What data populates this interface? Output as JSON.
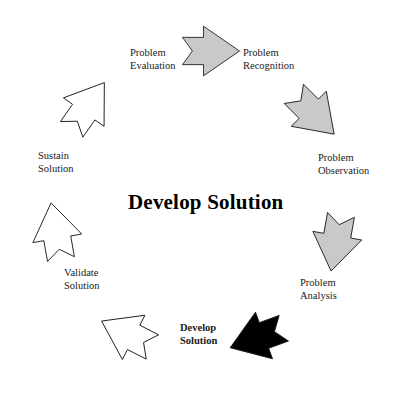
{
  "diagram": {
    "title": "Develop Solution",
    "title_position": {
      "x": 128,
      "y": 190
    },
    "type": "circular-process-cycle",
    "colors": {
      "arrow_gray_fill": "#c9c9c9",
      "arrow_white_fill": "#ffffff",
      "arrow_black_fill": "#000000",
      "arrow_outline": "#1a1a1a",
      "text": "#1a1a1a",
      "background": "#ffffff"
    },
    "stages": [
      {
        "id": "problem-recognition",
        "label_line1": "Problem",
        "label_line2": "Recognition",
        "label_x": 243,
        "label_y": 47,
        "label_align": "l",
        "arrow_fill": "#c9c9c9",
        "arrow_rotation": 0,
        "arrow_cx": 211,
        "arrow_cy": 51,
        "arrow_scale": 0.62
      },
      {
        "id": "problem-observation",
        "label_line1": "Problem",
        "label_line2": "Observation",
        "label_x": 318,
        "label_y": 152,
        "label_align": "l",
        "arrow_fill": "#c9c9c9",
        "arrow_rotation": 45,
        "arrow_cx": 314,
        "arrow_cy": 114,
        "arrow_scale": 0.62
      },
      {
        "id": "problem-analysis",
        "label_line1": "Problem",
        "label_line2": "Analysis",
        "label_x": 300,
        "label_y": 277,
        "label_align": "l",
        "arrow_fill": "#c9c9c9",
        "arrow_rotation": 100,
        "arrow_cx": 336,
        "arrow_cy": 243,
        "arrow_scale": 0.62
      },
      {
        "id": "develop-solution",
        "label_line1": "Develop",
        "label_line2": "Solution",
        "label_x": 180,
        "label_y": 322,
        "label_align": "l",
        "label_bold": true,
        "arrow_fill": "#000000",
        "arrow_rotation": 160,
        "arrow_cx": 257,
        "arrow_cy": 338,
        "arrow_scale": 0.62
      },
      {
        "id": "validate-solution-arrow-stage",
        "label_line1": "",
        "label_line2": "",
        "label_x": 0,
        "label_y": 0,
        "label_align": "l",
        "arrow_fill": "#ffffff",
        "arrow_rotation": 207,
        "arrow_cx": 127,
        "arrow_cy": 334,
        "arrow_scale": 0.62
      },
      {
        "id": "validate-solution",
        "label_line1": "Validate",
        "label_line2": "Solution",
        "label_x": 64,
        "label_y": 267,
        "label_align": "l",
        "arrow_fill": "#ffffff",
        "arrow_rotation": 260,
        "arrow_cx": 56,
        "arrow_cy": 231,
        "arrow_scale": 0.62
      },
      {
        "id": "sustain-solution",
        "label_line1": "Sustain",
        "label_line2": "Solution",
        "label_x": 38,
        "label_y": 150,
        "label_align": "l",
        "arrow_fill": "#ffffff",
        "arrow_rotation": 305,
        "arrow_cx": 88,
        "arrow_cy": 106,
        "arrow_scale": 0.62
      },
      {
        "id": "problem-evaluation",
        "label_line1": "Problem",
        "label_line2": "Evaluation",
        "label_x": 130,
        "label_y": 47,
        "label_align": "l",
        "arrow_fill": "#c9c9c9",
        "arrow_rotation": 0,
        "arrow_cx": -999,
        "arrow_cy": -999,
        "arrow_scale": 0.62
      }
    ]
  }
}
